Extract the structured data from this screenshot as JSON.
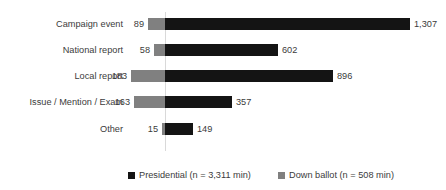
{
  "chart_data": {
    "type": "bar",
    "orientation": "horizontal",
    "style": "diverging-bar",
    "title": "",
    "subtitle": "",
    "xlabel": "",
    "ylabel": "",
    "grid": false,
    "axis_zero_line": true,
    "legend_position": "bottom",
    "categories": [
      "Campaign event",
      "National report",
      "Local report",
      "Issue / Mention / Exam",
      "Other"
    ],
    "series": [
      {
        "name": "Presidential (n = 3,311 min)",
        "short_name": "Presidential",
        "color": "#141414",
        "direction": "right",
        "values": [
          1307,
          602,
          896,
          357,
          149
        ],
        "value_labels": [
          "1,307",
          "602",
          "896",
          "357",
          "149"
        ],
        "total": 3311
      },
      {
        "name": "Down ballot (n = 508 min)",
        "short_name": "Down ballot",
        "color": "#808080",
        "direction": "left",
        "values": [
          89,
          58,
          183,
          163,
          15
        ],
        "value_labels": [
          "89",
          "58",
          "183",
          "163",
          "15"
        ],
        "total": 508
      }
    ],
    "xlim": [
      -250,
      1400
    ],
    "units": "minutes"
  },
  "legend": {
    "items": [
      {
        "label": "Presidential (n = 3,311 min)",
        "color": "#141414"
      },
      {
        "label": "Down ballot (n = 508 min)",
        "color": "#808080"
      }
    ]
  },
  "colors": {
    "presidential": "#141414",
    "down_ballot": "#808080",
    "axis_line": "#d9d9d9",
    "text": "#3b3b3b",
    "background": "#ffffff"
  }
}
